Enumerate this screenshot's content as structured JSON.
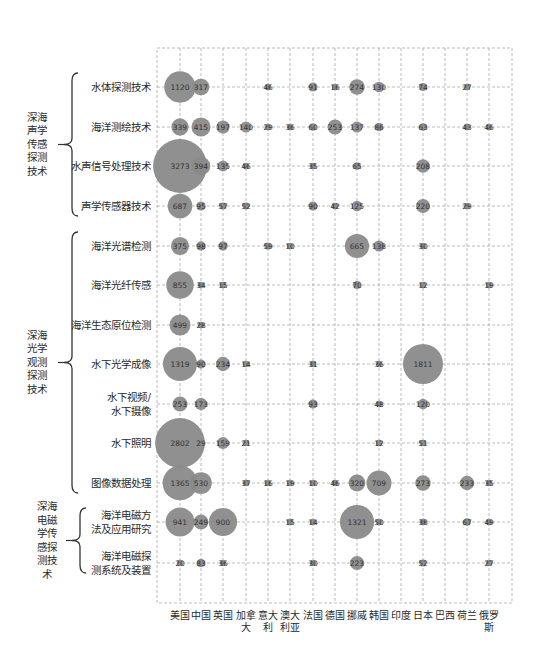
{
  "chart_data": {
    "type": "bubble",
    "title": "",
    "xlabel": "",
    "ylabel": "",
    "grid": true,
    "bubble_color": "#8a8a8a",
    "categories": [
      "美国",
      "中国",
      "英国",
      "加拿大",
      "意大利",
      "澳大利亚",
      "法国",
      "德国",
      "挪威",
      "韩国",
      "印度",
      "日本",
      "巴西",
      "荷兰",
      "俄罗斯"
    ],
    "category_labels": [
      [
        "美国"
      ],
      [
        "中国"
      ],
      [
        "英国"
      ],
      [
        "加拿",
        "大"
      ],
      [
        "意大",
        "利"
      ],
      [
        "澳大",
        "利亚"
      ],
      [
        "法国"
      ],
      [
        "德国"
      ],
      [
        "挪威"
      ],
      [
        "韩国"
      ],
      [
        "印度"
      ],
      [
        "日本"
      ],
      [
        "巴西"
      ],
      [
        "荷兰"
      ],
      [
        "俄罗",
        "斯"
      ]
    ],
    "groups": [
      {
        "label": [
          "深海",
          "声学",
          "传感",
          "探测",
          "技术"
        ],
        "rows": [
          0,
          1,
          2,
          3
        ]
      },
      {
        "label": [
          "深海",
          "光学",
          "观测",
          "探测",
          "技术"
        ],
        "rows": [
          4,
          5,
          6,
          7,
          8,
          9,
          10
        ]
      },
      {
        "label": [
          "深海",
          "电磁",
          "学传",
          "感探",
          "测技",
          "术"
        ],
        "rows": [
          11,
          12
        ]
      }
    ],
    "rows": [
      {
        "label": [
          "水体探测技术"
        ],
        "values": [
          1120,
          317,
          null,
          null,
          46,
          null,
          91,
          16,
          274,
          130,
          null,
          74,
          null,
          27,
          null
        ]
      },
      {
        "label": [
          "海洋测绘技术"
        ],
        "values": [
          339,
          415,
          197,
          140,
          29,
          36,
          60,
          253,
          137,
          86,
          null,
          63,
          null,
          43,
          46
        ]
      },
      {
        "label": [
          "水声信号处理技术"
        ],
        "values": [
          3273,
          394,
          135,
          46,
          null,
          null,
          35,
          null,
          65,
          null,
          null,
          208,
          null,
          null,
          null
        ]
      },
      {
        "label": [
          "声学传感器技术"
        ],
        "values": [
          687,
          95,
          57,
          52,
          null,
          null,
          90,
          42,
          125,
          null,
          null,
          220,
          null,
          29,
          null
        ]
      },
      {
        "label": [
          "海洋光谱检测"
        ],
        "values": [
          375,
          98,
          97,
          null,
          59,
          10,
          null,
          null,
          665,
          138,
          null,
          30,
          null,
          null,
          null
        ]
      },
      {
        "label": [
          "海洋光纤传感"
        ],
        "values": [
          855,
          34,
          15,
          null,
          null,
          null,
          null,
          null,
          70,
          null,
          null,
          12,
          null,
          null,
          19
        ]
      },
      {
        "label": [
          "海洋生态原位检测"
        ],
        "values": [
          499,
          28,
          null,
          null,
          null,
          null,
          null,
          null,
          null,
          null,
          null,
          null,
          null,
          null,
          null
        ]
      },
      {
        "label": [
          "水下光学成像"
        ],
        "values": [
          1319,
          90,
          234,
          14,
          null,
          null,
          31,
          null,
          null,
          36,
          null,
          1811,
          null,
          null,
          null
        ]
      },
      {
        "label": [
          "水下视频/",
          "水下摄像"
        ],
        "values": [
          253,
          173,
          null,
          null,
          null,
          null,
          93,
          null,
          null,
          48,
          null,
          120,
          null,
          null,
          null
        ]
      },
      {
        "label": [
          "水下照明"
        ],
        "values": [
          2802,
          29,
          159,
          21,
          null,
          null,
          null,
          null,
          null,
          12,
          null,
          51,
          null,
          null,
          null
        ]
      },
      {
        "label": [
          "图像数据处理"
        ],
        "values": [
          1365,
          530,
          null,
          37,
          16,
          19,
          10,
          46,
          320,
          709,
          null,
          273,
          null,
          233,
          35
        ]
      },
      {
        "label": [
          "海洋电磁方",
          "法及应用研究"
        ],
        "values": [
          941,
          249,
          900,
          null,
          null,
          15,
          14,
          null,
          1321,
          50,
          null,
          38,
          null,
          67,
          49
        ]
      },
      {
        "label": [
          "海洋电磁探",
          "测系统及装置"
        ],
        "values": [
          20,
          83,
          36,
          null,
          null,
          null,
          30,
          null,
          223,
          null,
          null,
          52,
          null,
          null,
          27
        ]
      }
    ]
  }
}
